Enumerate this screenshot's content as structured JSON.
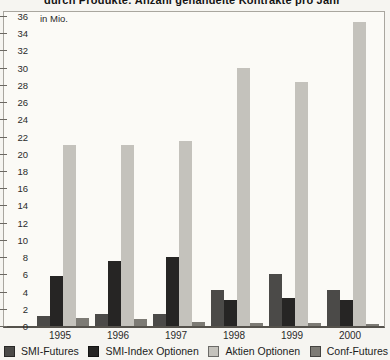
{
  "chart_title": "durch Produkte: Anzahl gehandelte Kontrakte pro Jahr",
  "chart_data": {
    "type": "bar",
    "title": "durch Produkte: Anzahl gehandelte Kontrakte pro Jahr",
    "unit_label": "in Mio.",
    "xlabel": "",
    "ylabel": "in Mio.",
    "ylim": [
      0,
      36
    ],
    "ytick_step": 2,
    "grid": false,
    "legend_position": "bottom",
    "categories": [
      "1995",
      "1996",
      "1997",
      "1998",
      "1999",
      "2000"
    ],
    "series": [
      {
        "name": "SMI-Futures",
        "color": "#4b4a48",
        "values": [
          1.2,
          1.4,
          1.4,
          4.2,
          6.0,
          4.2
        ]
      },
      {
        "name": "SMI-Index Optionen",
        "color": "#262524",
        "values": [
          5.8,
          7.5,
          8.0,
          3.0,
          3.3,
          3.0
        ]
      },
      {
        "name": "Aktien Optionen",
        "color": "#c4c2bc",
        "values": [
          21.0,
          21.0,
          21.5,
          30.0,
          28.3,
          35.3
        ]
      },
      {
        "name": "Conf-Futures",
        "color": "#7d7b75",
        "values": [
          0.9,
          0.8,
          0.45,
          0.35,
          0.3,
          0.2
        ]
      }
    ]
  }
}
